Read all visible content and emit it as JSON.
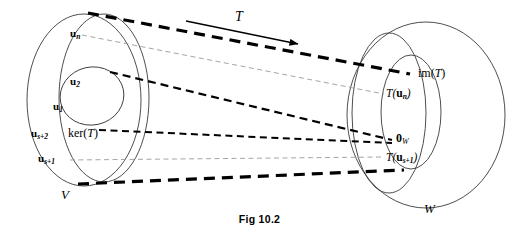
{
  "figure": {
    "caption": "Fig 10.2",
    "transformation_label": "T",
    "domain": {
      "outer_set_label": "V",
      "kernel_label_prefix": "ker(",
      "kernel_label_arg": "T",
      "kernel_label_suffix": ")",
      "basis_vectors": [
        {
          "symbol": "u",
          "subscript": "1"
        },
        {
          "symbol": "u",
          "subscript": "2"
        },
        {
          "symbol": "u",
          "subscript": "s+1"
        },
        {
          "symbol": "u",
          "subscript": "s+2"
        },
        {
          "symbol": "u",
          "subscript": "n"
        }
      ]
    },
    "codomain": {
      "outer_set_label": "W",
      "image_label_prefix": "im(",
      "image_label_arg": "T",
      "image_label_suffix": ")",
      "zero_symbol": "0",
      "zero_subscript": "W",
      "images": [
        {
          "prefix": "T(",
          "symbol": "u",
          "subscript": "n",
          "suffix": ")"
        },
        {
          "prefix": "T(",
          "symbol": "u",
          "subscript": "s+1",
          "suffix": ")"
        }
      ]
    },
    "colors": {
      "ink": "#000000",
      "outline": "#3a3a3a",
      "faint_line": "#9a9a9a",
      "background": "#ffffff"
    }
  }
}
